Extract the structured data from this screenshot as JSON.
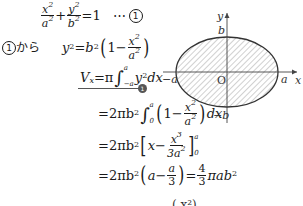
{
  "equation1": {
    "lhs_frac1_num": "x",
    "lhs_frac1_num_exp": "2",
    "lhs_frac1_den": "a",
    "lhs_frac1_den_exp": "2",
    "plus": "+",
    "lhs_frac2_num": "y",
    "lhs_frac2_num_exp": "2",
    "lhs_frac2_den": "b",
    "lhs_frac2_den_exp": "2",
    "rhs": "=1",
    "dots": "⋯",
    "label": "1"
  },
  "step1": {
    "label_circle": "1",
    "label_text": "から",
    "lhs": "y",
    "lhs_exp": "2",
    "eq": "=",
    "coef": "b",
    "coef_exp": "2",
    "inner_one": "1−",
    "frac_num": "x",
    "frac_num_exp": "2",
    "frac_den": "a",
    "frac_den_exp": "2"
  },
  "step2": {
    "lhs": "V",
    "lhs_sub": "x",
    "eq": "=π",
    "upper": "a",
    "lower": "−a",
    "integrand": "y",
    "integrand_exp": "2",
    "dx": "dx",
    "marker": "1"
  },
  "step3": {
    "eq": "=2πb",
    "exp": "2",
    "upper": "a",
    "lower": "0",
    "inner_one": "1−",
    "frac_num": "x",
    "frac_num_exp": "2",
    "frac_den": "a",
    "frac_den_exp": "2",
    "dx": "dx"
  },
  "step4": {
    "eq": "=2πb",
    "exp": "2",
    "inner": "x−",
    "frac_num": "x",
    "frac_num_exp": "3",
    "frac_den": "3a",
    "frac_den_exp": "2",
    "upper": "a",
    "lower": "0"
  },
  "step5": {
    "eq": "=2πb",
    "exp": "2",
    "inner": "a−",
    "frac_num": "a",
    "frac_den": "3",
    "eq2": "=",
    "res_num": "4",
    "res_den": "3",
    "res_tail": "πab",
    "res_exp": "2"
  },
  "partial_next_line": "(    x²)",
  "graph": {
    "y_axis_label": "y",
    "x_axis_label": "x",
    "origin_label": "O",
    "top_label": "b",
    "bottom_label": "−b",
    "left_label": "−a",
    "right_label": "a",
    "fill_pattern": "diagonal-hatch",
    "stroke_color": "#333333"
  }
}
